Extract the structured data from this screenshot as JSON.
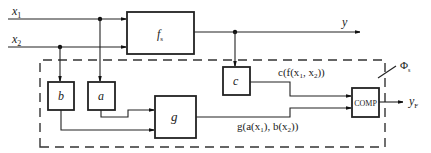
{
  "diagram": {
    "inputs": {
      "x1": {
        "base": "x",
        "sub": "1"
      },
      "x2": {
        "base": "x",
        "sub": "2"
      }
    },
    "blocks": {
      "fs": {
        "base": "f",
        "sub": "s"
      },
      "a": {
        "label": "a"
      },
      "b": {
        "label": "b"
      },
      "c": {
        "label": "c"
      },
      "g": {
        "label": "g"
      },
      "comp": {
        "label": "COMP"
      }
    },
    "outputs": {
      "y": {
        "label": "y"
      },
      "yF": {
        "base": "y",
        "sub": "F"
      }
    },
    "signals": {
      "c_of_f": {
        "p1": "c(f(x",
        "s1": "1",
        "p2": ", x",
        "s2": "2",
        "p3": "))"
      },
      "g_of_ab": {
        "p1": "g(a(x",
        "s1": "1",
        "p2": "), b(x",
        "s2": "2",
        "p3": "))"
      }
    },
    "checker_label": {
      "base": "Φ",
      "sub": "s"
    }
  }
}
